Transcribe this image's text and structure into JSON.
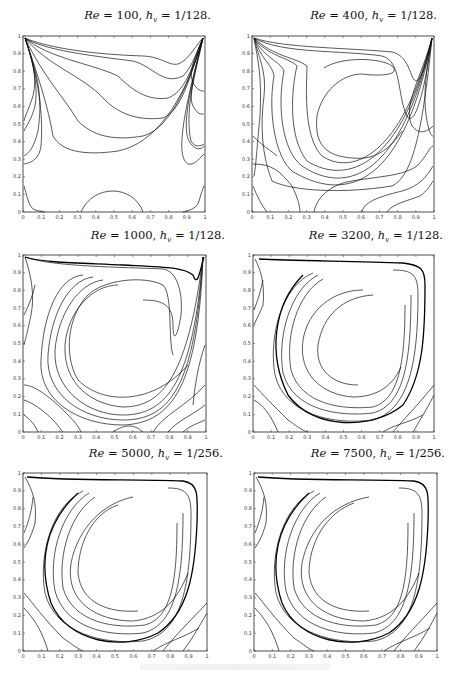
{
  "figure": {
    "panels": [
      {
        "id": "re100",
        "title_re": "Re",
        "title_re_val": " = 100, ",
        "title_h": "h",
        "title_h_sub": "v",
        "title_h_val": " = 1/128."
      },
      {
        "id": "re400",
        "title_re": "Re",
        "title_re_val": " = 400, ",
        "title_h": "h",
        "title_h_sub": "v",
        "title_h_val": " = 1/128."
      },
      {
        "id": "re1000",
        "title_re": "Re",
        "title_re_val": " = 1000, ",
        "title_h": "h",
        "title_h_sub": "v",
        "title_h_val": " = 1/128."
      },
      {
        "id": "re3200",
        "title_re": "Re",
        "title_re_val": " = 3200, ",
        "title_h": "h",
        "title_h_sub": "v",
        "title_h_val": " = 1/128."
      },
      {
        "id": "re5000",
        "title_re": "Re",
        "title_re_val": " = 5000, ",
        "title_h": "h",
        "title_h_sub": "v",
        "title_h_val": " = 1/256."
      },
      {
        "id": "re7500",
        "title_re": "Re",
        "title_re_val": " = 7500, ",
        "title_h": "h",
        "title_h_sub": "v",
        "title_h_val": " = 1/256."
      }
    ],
    "x_ticks": [
      "0",
      "0.1",
      "0.2",
      "0.3",
      "0.4",
      "0.5",
      "0.6",
      "0.7",
      "0.8",
      "0.9",
      "1"
    ],
    "y_ticks": [
      "0",
      "0.1",
      "0.2",
      "0.3",
      "0.4",
      "0.5",
      "0.6",
      "0.7",
      "0.8",
      "0.9",
      "1"
    ]
  },
  "chart_data": [
    {
      "type": "contour",
      "title": "Re = 100, h_v = 1/128.",
      "xlim": [
        0,
        1
      ],
      "ylim": [
        0,
        1
      ],
      "xticks": [
        0,
        0.1,
        0.2,
        0.3,
        0.4,
        0.5,
        0.6,
        0.7,
        0.8,
        0.9,
        1
      ],
      "yticks": [
        0,
        0.1,
        0.2,
        0.3,
        0.4,
        0.5,
        0.6,
        0.7,
        0.8,
        0.9,
        1
      ],
      "description": "Lid-driven cavity streamlines; lines fan from top corners, small bottom recirculation near x=0.3-0.67"
    },
    {
      "type": "contour",
      "title": "Re = 400, h_v = 1/128.",
      "xlim": [
        0,
        1
      ],
      "ylim": [
        0,
        1
      ],
      "xticks": [
        0,
        0.1,
        0.2,
        0.3,
        0.4,
        0.5,
        0.6,
        0.7,
        0.8,
        0.9,
        1
      ],
      "yticks": [
        0,
        0.1,
        0.2,
        0.3,
        0.4,
        0.5,
        0.6,
        0.7,
        0.8,
        0.9,
        1
      ],
      "description": "Primary vortex centered near (0.55,0.6)"
    },
    {
      "type": "contour",
      "title": "Re = 1000, h_v = 1/128.",
      "xlim": [
        0,
        1
      ],
      "ylim": [
        0,
        1
      ],
      "xticks": [
        0,
        0.1,
        0.2,
        0.3,
        0.4,
        0.5,
        0.6,
        0.7,
        0.8,
        0.9,
        1
      ],
      "yticks": [
        0,
        0.1,
        0.2,
        0.3,
        0.4,
        0.5,
        0.6,
        0.7,
        0.8,
        0.9,
        1
      ],
      "description": "Primary vortex centered near (0.53,0.57); corner eddies"
    },
    {
      "type": "contour",
      "title": "Re = 3200, h_v = 1/128.",
      "xlim": [
        0,
        1
      ],
      "ylim": [
        0,
        1
      ],
      "xticks": [
        0,
        0.1,
        0.2,
        0.3,
        0.4,
        0.5,
        0.6,
        0.7,
        0.8,
        0.9,
        1
      ],
      "yticks": [
        0,
        0.1,
        0.2,
        0.3,
        0.4,
        0.5,
        0.6,
        0.7,
        0.8,
        0.9,
        1
      ],
      "description": "Primary vortex near (0.52,0.55); bottom-right and bottom-left secondary eddies"
    },
    {
      "type": "contour",
      "title": "Re = 5000, h_v = 1/256.",
      "xlim": [
        0,
        1
      ],
      "ylim": [
        0,
        1
      ],
      "xticks": [
        0,
        0.1,
        0.2,
        0.3,
        0.4,
        0.5,
        0.6,
        0.7,
        0.8,
        0.9,
        1
      ],
      "yticks": [
        0,
        0.1,
        0.2,
        0.3,
        0.4,
        0.5,
        0.6,
        0.7,
        0.8,
        0.9,
        1
      ],
      "description": "Primary vortex near (0.52,0.54); thin shear layers"
    },
    {
      "type": "contour",
      "title": "Re = 7500, h_v = 1/256.",
      "xlim": [
        0,
        1
      ],
      "ylim": [
        0,
        1
      ],
      "xticks": [
        0,
        0.1,
        0.2,
        0.3,
        0.4,
        0.5,
        0.6,
        0.7,
        0.8,
        0.9,
        1
      ],
      "yticks": [
        0,
        0.1,
        0.2,
        0.3,
        0.4,
        0.5,
        0.6,
        0.7,
        0.8,
        0.9,
        1
      ],
      "description": "Primary vortex near (0.52,0.53); thin shear layers"
    }
  ]
}
